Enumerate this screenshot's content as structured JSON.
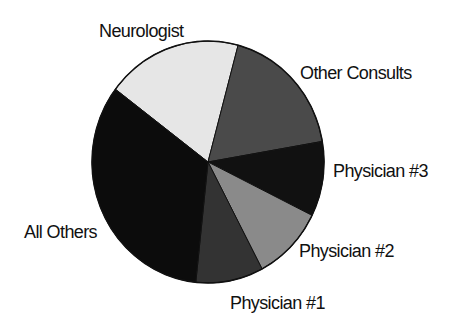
{
  "chart_data": {
    "type": "pie",
    "title": "",
    "start_angle_deg": 307,
    "direction": "clockwise",
    "legend": "none (direct slice labels)",
    "slices": [
      {
        "label": "Neurologist",
        "value": 18.9,
        "color": "#e6e6e6"
      },
      {
        "label": "Other Consults",
        "value": 18.1,
        "color": "#4a4a4a"
      },
      {
        "label": "Physician #3",
        "value": 10.0,
        "color": "#111111"
      },
      {
        "label": "Physician #2",
        "value": 10.0,
        "color": "#8a8a8a"
      },
      {
        "label": "Physician #1",
        "value": 9.4,
        "color": "#333333"
      },
      {
        "label": "All Others",
        "value": 33.6,
        "color": "#0c0c0c"
      }
    ]
  },
  "labels": {
    "neurologist": "Neurologist",
    "other_consults": "Other Consults",
    "physician_3": "Physician #3",
    "physician_2": "Physician #2",
    "physician_1": "Physician #1",
    "all_others": "All Others"
  }
}
